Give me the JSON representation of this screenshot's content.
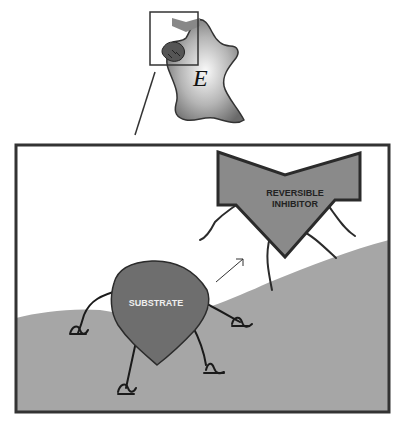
{
  "diagram": {
    "enzyme_label": "E",
    "substrate_label": "SUBSTRATE",
    "inhibitor_label_line1": "REVERSIBLE",
    "inhibitor_label_line2": "INHIBITOR"
  },
  "colors": {
    "frame": "#333333",
    "ground": "#a6a6a6",
    "substrate_fill": "#6e6e6e",
    "inhibitor_fill": "#8a8a8a",
    "outline": "#2b2b2b",
    "substrate_text": "#eeeeee",
    "inhibitor_text": "#222222"
  }
}
